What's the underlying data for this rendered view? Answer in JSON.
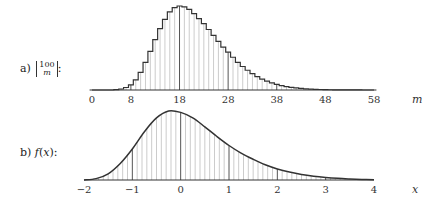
{
  "panels": [
    {
      "label_prefix": "a)",
      "label_math": "|100 m|:",
      "label_text": "a) |¹⁰⁰ₘ|:"
    },
    {
      "label_prefix": "b)",
      "label_math": "f(x):",
      "label_text": "b) f(x):"
    }
  ],
  "chart_data": [
    {
      "type": "bar",
      "title": "a) |100 choose m| (step histogram)",
      "xlabel": "m",
      "ylabel": "",
      "x_ticks": [
        0,
        8,
        18,
        28,
        38,
        48,
        58
      ],
      "xlim": [
        0,
        58
      ],
      "grid": false,
      "bold_lines_at": [
        8,
        18,
        28,
        38,
        48
      ],
      "categories": [
        0,
        1,
        2,
        3,
        4,
        5,
        6,
        7,
        8,
        9,
        10,
        11,
        12,
        13,
        14,
        15,
        16,
        17,
        18,
        19,
        20,
        21,
        22,
        23,
        24,
        25,
        26,
        27,
        28,
        29,
        30,
        31,
        32,
        33,
        34,
        35,
        36,
        37,
        38,
        39,
        40,
        41,
        42,
        43,
        44,
        45,
        46,
        47,
        48,
        49,
        50,
        51,
        52,
        53,
        54,
        55,
        56,
        57,
        58
      ],
      "values": [
        0,
        0,
        0,
        0,
        0,
        0.005,
        0.012,
        0.03,
        0.06,
        0.12,
        0.21,
        0.33,
        0.46,
        0.6,
        0.73,
        0.84,
        0.93,
        0.98,
        1.0,
        0.99,
        0.96,
        0.91,
        0.85,
        0.79,
        0.72,
        0.65,
        0.58,
        0.51,
        0.45,
        0.39,
        0.33,
        0.28,
        0.235,
        0.195,
        0.16,
        0.13,
        0.105,
        0.085,
        0.067,
        0.053,
        0.041,
        0.032,
        0.025,
        0.019,
        0.014,
        0.011,
        0.008,
        0.006,
        0.004,
        0.003,
        0.002,
        0.0015,
        0.001,
        0.0007,
        0.0005,
        0.0003,
        0.0002,
        0.0001,
        0
      ]
    },
    {
      "type": "area",
      "title": "b) f(x)",
      "xlabel": "x",
      "ylabel": "",
      "x_ticks": [
        -2,
        -1,
        0,
        1,
        2,
        3,
        4
      ],
      "xlim": [
        -2,
        4
      ],
      "grid": false,
      "bold_lines_at": [
        -1,
        0,
        1,
        2,
        3
      ],
      "x": [
        -2,
        -1.75,
        -1.5,
        -1.25,
        -1,
        -0.75,
        -0.5,
        -0.25,
        0,
        0.25,
        0.5,
        0.75,
        1,
        1.25,
        1.5,
        1.75,
        2,
        2.25,
        2.5,
        2.75,
        3,
        3.25,
        3.5,
        3.75,
        4
      ],
      "y": [
        0,
        0.02,
        0.09,
        0.24,
        0.45,
        0.7,
        0.9,
        1.0,
        0.98,
        0.9,
        0.77,
        0.63,
        0.5,
        0.39,
        0.3,
        0.22,
        0.16,
        0.115,
        0.08,
        0.055,
        0.037,
        0.024,
        0.015,
        0.008,
        0.004
      ]
    }
  ]
}
